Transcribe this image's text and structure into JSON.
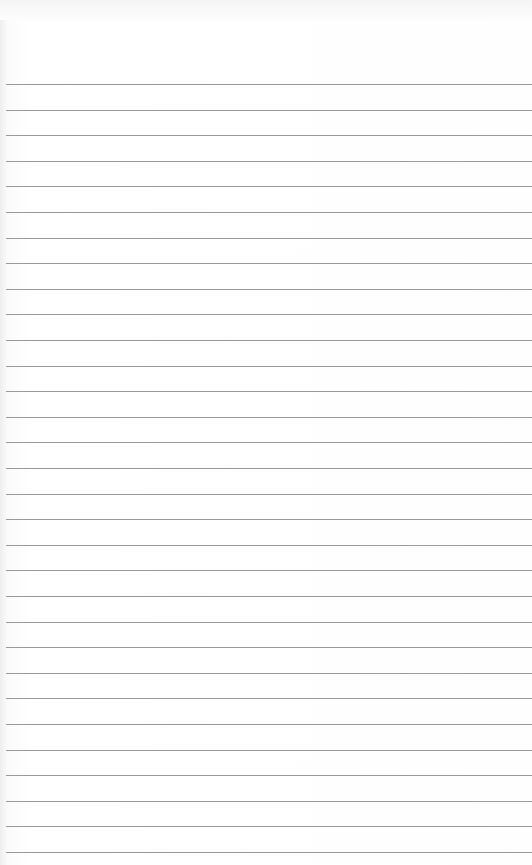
{
  "paper": {
    "type": "lined notebook paper",
    "background_color": "#ffffff",
    "rule_color": "#9a9a9a",
    "first_rule_y": 84,
    "rule_spacing": 25.6,
    "rule_count": 31
  }
}
